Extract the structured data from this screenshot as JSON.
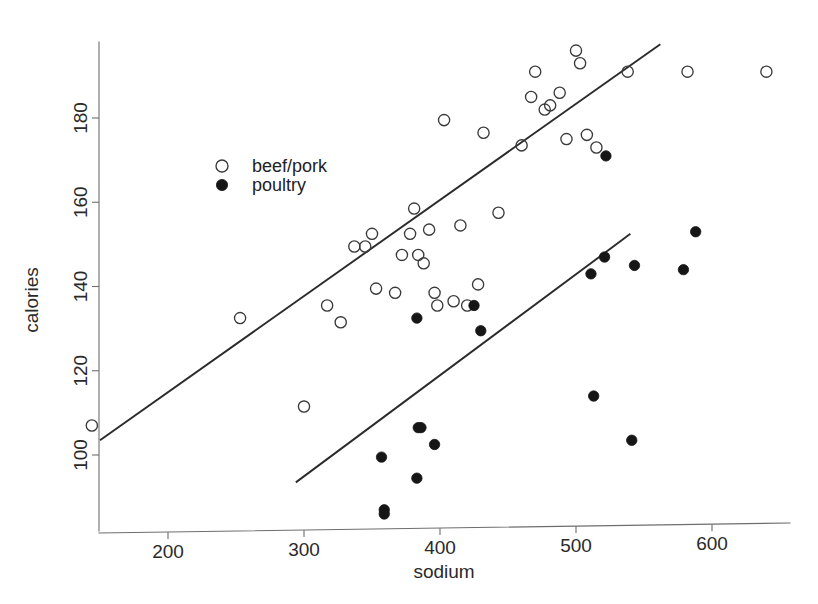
{
  "chart_data": {
    "type": "scatter",
    "title": "",
    "xlabel": "sodium",
    "ylabel": "calories",
    "xlim": [
      130,
      680
    ],
    "ylim": [
      83,
      200
    ],
    "grid": false,
    "legend_position": "upper-left-inside",
    "xticks": [
      200,
      300,
      400,
      500,
      600
    ],
    "yticks": [
      100,
      120,
      140,
      160,
      180
    ],
    "xtick_labels": [
      "200",
      "300",
      "400",
      "500",
      "600"
    ],
    "ytick_labels": [
      "100",
      "120",
      "140",
      "160",
      "180"
    ],
    "series": [
      {
        "name": "beef/pork",
        "marker": "open-circle",
        "color": "#3a3a3a",
        "points": [
          [
            144,
            107
          ],
          [
            253,
            132.5
          ],
          [
            300,
            111.5
          ],
          [
            317,
            135.5
          ],
          [
            327,
            131.5
          ],
          [
            337,
            149.5
          ],
          [
            345,
            149.5
          ],
          [
            350,
            152.5
          ],
          [
            353,
            139.5
          ],
          [
            367,
            138.5
          ],
          [
            372,
            147.5
          ],
          [
            378,
            152.5
          ],
          [
            381,
            158.5
          ],
          [
            384,
            147.5
          ],
          [
            388,
            145.5
          ],
          [
            392,
            153.5
          ],
          [
            396,
            138.5
          ],
          [
            398,
            135.5
          ],
          [
            403,
            179.5
          ],
          [
            410,
            136.5
          ],
          [
            415,
            154.5
          ],
          [
            420,
            135.5
          ],
          [
            428,
            140.5
          ],
          [
            432,
            176.5
          ],
          [
            443,
            157.5
          ],
          [
            460,
            173.5
          ],
          [
            467,
            185
          ],
          [
            470,
            191
          ],
          [
            477,
            182
          ],
          [
            481,
            183
          ],
          [
            488,
            186
          ],
          [
            493,
            175
          ],
          [
            500,
            196
          ],
          [
            503,
            193
          ],
          [
            508,
            176
          ],
          [
            515,
            173
          ],
          [
            538,
            191
          ],
          [
            582,
            191
          ],
          [
            640,
            191
          ]
        ]
      },
      {
        "name": "poultry",
        "marker": "filled-circle",
        "color": "#161616",
        "points": [
          [
            357,
            99.5
          ],
          [
            359,
            87
          ],
          [
            359,
            86
          ],
          [
            383,
            94.5
          ],
          [
            384,
            106.5
          ],
          [
            386,
            106.5
          ],
          [
            396,
            102.5
          ],
          [
            383,
            132.5
          ],
          [
            425,
            135.5
          ],
          [
            430,
            129.5
          ],
          [
            511,
            143
          ],
          [
            513,
            114
          ],
          [
            521,
            147
          ],
          [
            522,
            171
          ],
          [
            541,
            103.5
          ],
          [
            543,
            145
          ],
          [
            579,
            144
          ],
          [
            588,
            153
          ]
        ]
      }
    ],
    "fit_lines": [
      {
        "series": "beef/pork",
        "x_start": 150,
        "y_start": 103.5,
        "x_end": 562,
        "y_end": 197.5
      },
      {
        "series": "poultry",
        "x_start": 294,
        "y_start": 93.5,
        "x_end": 540,
        "y_end": 152.5
      }
    ]
  },
  "legend": {
    "items": [
      {
        "label": "beef/pork",
        "marker": "open-circle"
      },
      {
        "label": "poultry",
        "marker": "filled-circle"
      }
    ]
  },
  "axes": {
    "x_title": "sodium",
    "y_title": "calories"
  }
}
